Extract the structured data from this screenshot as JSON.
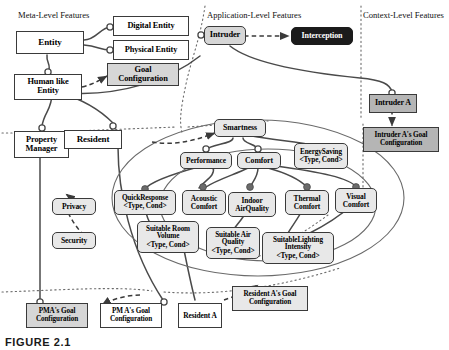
{
  "figure": {
    "caption": "FIGURE 2.1",
    "layers": [
      {
        "id": "meta",
        "label": "Meta-Level Features"
      },
      {
        "id": "app",
        "label": "Application-Level Features"
      },
      {
        "id": "context",
        "label": "Context-Level Features"
      }
    ]
  },
  "colors": {
    "white": "#ffffff",
    "light_gray": "#e8e8e8",
    "gray": "#d6d6d6",
    "mid_gray": "#b5b5b5",
    "black_box": "#1b1b1b",
    "line": "#4a4a4a",
    "text": "#000000"
  },
  "nodes": {
    "entity": "Entity",
    "digital_entity": "Digital Entity",
    "physical_entity": "Physical Entity",
    "goal_configuration": "Goal Configuration",
    "human_like_entity": "Human like Entity",
    "intruder": "Intruder",
    "interception": "Interception",
    "intruder_a": "Intruder A",
    "intruder_a_goal_configuration": "Intruder A's Goal Configuration",
    "property_manager": "Property Manager",
    "resident": "Resident",
    "privacy": "Privacy",
    "security": "Security",
    "smartness": "Smartness",
    "performance": "Performance",
    "comfort": "Comfort",
    "energy_saving": "EnergySaving",
    "energy_saving_params": "<Type, Cond>",
    "quick_response": "QuickResponse",
    "quick_response_params": "<Type, Cond>",
    "acoustic_comfort": "Acoustic Comfort",
    "indoor_air_quality": "Indoor AirQuality",
    "thermal_comfort": "Thermal Comfort",
    "visual_comfort": "Visual Comfort",
    "suitable_room_volume": "Suitable Room Volume",
    "suitable_room_volume_params": "<Type, Cond>",
    "suitable_air_quality": "Suitable Air Quality",
    "suitable_air_quality_params": "<Type, Cond>",
    "suitable_lighting_intensity": "SuitableLighting Intensity",
    "suitable_lighting_intensity_params": "<Type, Cond>",
    "pma_goal_configuration_filled": "PMA's Goal Configuration",
    "pma_goal_configuration": "PM A's Goal Configuration",
    "resident_a": "Resident A",
    "resident_a_goal_configuration": "Resident A's Goal Configuration"
  },
  "legend": {
    "mandatory_marker": "filled-circle",
    "optional_marker": "hollow-circle",
    "derivation_edge": "dashed-arrow",
    "composition_edge": "solid-curve",
    "layer_divider": "dotted-line"
  }
}
